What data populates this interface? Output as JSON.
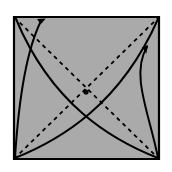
{
  "figure": {
    "type": "geometric-diagram",
    "canvas": {
      "width": 172,
      "height": 172,
      "background": "#ffffff"
    },
    "colors": {
      "square_fill": "#aaaaaa",
      "square_stroke": "#000000",
      "line": "#000000",
      "dash": "#000000",
      "dot": "#000000",
      "background": "#ffffff"
    },
    "square": {
      "label": "square-panel",
      "corners": {
        "top_left": [
          14,
          17
        ],
        "top_right": [
          159,
          17
        ],
        "bottom_right": [
          159,
          159
        ],
        "bottom_left": [
          14,
          159
        ]
      },
      "stroke_width": 2.2,
      "fill": "#aaaaaa"
    },
    "diagonals": [
      {
        "label": "diagonal-tl-br",
        "from": [
          14,
          17
        ],
        "to": [
          159,
          159
        ],
        "style": "dashed",
        "dash_pattern": "4 4",
        "stroke_width": 1.8
      },
      {
        "label": "diagonal-bl-tr",
        "from": [
          14,
          159
        ],
        "to": [
          159,
          17
        ],
        "style": "dashed",
        "dash_pattern": "4 4",
        "stroke_width": 1.8
      }
    ],
    "center_point": {
      "label": "center-dot",
      "position": [
        86,
        92
      ],
      "radius": 2.6
    },
    "arcs": [
      {
        "label": "arc-bl-to-tl-outer",
        "from": [
          15,
          158
        ],
        "control": [
          24,
          70
        ],
        "to": [
          40,
          20
        ],
        "style": "solid",
        "stroke_width": 2.0,
        "arrow": {
          "present": true,
          "at": [
            40,
            20
          ],
          "direction": "up-left",
          "angle_deg": -108
        }
      },
      {
        "label": "arc-bl-to-tr",
        "from": [
          15,
          158
        ],
        "control": [
          95,
          120
        ],
        "to": [
          158,
          19
        ],
        "style": "solid",
        "stroke_width": 2.0,
        "arrow": {
          "present": false
        }
      },
      {
        "label": "arc-br-to-tl",
        "from": [
          158,
          158
        ],
        "control": [
          72,
          118
        ],
        "to": [
          16,
          19
        ],
        "style": "solid",
        "stroke_width": 2.0,
        "arrow": {
          "present": false
        }
      },
      {
        "label": "arc-br-to-tr-inner",
        "from": [
          158,
          158
        ],
        "control": [
          120,
          95
        ],
        "to": [
          146,
          48
        ],
        "style": "solid",
        "stroke_width": 2.0,
        "arrow": {
          "present": true,
          "at": [
            146,
            48
          ],
          "direction": "up-right",
          "angle_deg": -55
        }
      }
    ],
    "arrow_heads": [
      {
        "label": "arrowhead-top-left",
        "tip": [
          37,
          19
        ],
        "size": 8,
        "rotation_deg": 200
      },
      {
        "label": "arrowhead-top-right",
        "tip": [
          148,
          45
        ],
        "size": 8,
        "rotation_deg": 305
      }
    ]
  }
}
